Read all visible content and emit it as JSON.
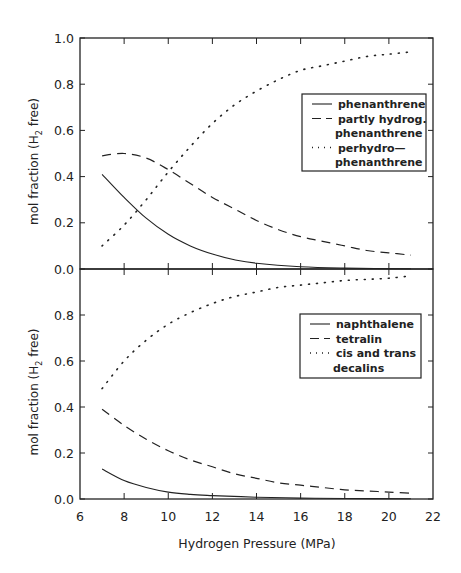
{
  "chart_data": [
    {
      "type": "line",
      "panel": "top",
      "title": "",
      "xlabel": "Hydrogen Pressure (MPa)",
      "ylabel": "mol fraction (H2 free)",
      "xlim": [
        6,
        22
      ],
      "ylim": [
        0,
        1.0
      ],
      "yticks": [
        "0.0",
        "0.2",
        "0.4",
        "0.6",
        "0.8",
        "1.0"
      ],
      "grid": false,
      "legend_position": "upper right",
      "series": [
        {
          "name": "phenanthrene",
          "style": "solid",
          "x": [
            7,
            8,
            9,
            10,
            11,
            12,
            13,
            14,
            16,
            18,
            21
          ],
          "values": [
            0.41,
            0.31,
            0.22,
            0.15,
            0.1,
            0.065,
            0.04,
            0.025,
            0.01,
            0.004,
            0.001
          ]
        },
        {
          "name": "partly hydrog. phenanthrene",
          "style": "dashed",
          "x": [
            7,
            8,
            9,
            10,
            11,
            12,
            13,
            14,
            15,
            16,
            17,
            18,
            19,
            20,
            21
          ],
          "values": [
            0.49,
            0.5,
            0.48,
            0.43,
            0.37,
            0.31,
            0.26,
            0.21,
            0.17,
            0.14,
            0.12,
            0.1,
            0.08,
            0.07,
            0.06
          ]
        },
        {
          "name": "perhydro-phenanthrene",
          "style": "dotted",
          "x": [
            7,
            8,
            9,
            10,
            11,
            12,
            13,
            14,
            15,
            16,
            17,
            18,
            19,
            20,
            21
          ],
          "values": [
            0.1,
            0.19,
            0.3,
            0.42,
            0.53,
            0.63,
            0.71,
            0.77,
            0.82,
            0.86,
            0.88,
            0.9,
            0.92,
            0.93,
            0.94
          ]
        }
      ]
    },
    {
      "type": "line",
      "panel": "bottom",
      "title": "",
      "xlabel": "Hydrogen Pressure (MPa)",
      "ylabel": "mol fraction (H2 free)",
      "xlim": [
        6,
        22
      ],
      "ylim": [
        0,
        1.0
      ],
      "xticks": [
        "6",
        "8",
        "10",
        "12",
        "14",
        "16",
        "18",
        "20",
        "22"
      ],
      "yticks": [
        "0.0",
        "0.2",
        "0.4",
        "0.6",
        "0.8"
      ],
      "grid": false,
      "legend_position": "upper right",
      "series": [
        {
          "name": "naphthalene",
          "style": "solid",
          "x": [
            7,
            8,
            9,
            10,
            11,
            12,
            14,
            16,
            18,
            21
          ],
          "values": [
            0.13,
            0.08,
            0.05,
            0.03,
            0.02,
            0.015,
            0.008,
            0.004,
            0.002,
            0.001
          ]
        },
        {
          "name": "tetralin",
          "style": "dashed",
          "x": [
            7,
            8,
            9,
            10,
            11,
            12,
            13,
            14,
            15,
            16,
            17,
            18,
            19,
            20,
            21
          ],
          "values": [
            0.39,
            0.32,
            0.26,
            0.21,
            0.17,
            0.14,
            0.11,
            0.09,
            0.07,
            0.06,
            0.05,
            0.04,
            0.035,
            0.03,
            0.025
          ]
        },
        {
          "name": "cis and trans decalins",
          "style": "dotted",
          "x": [
            7,
            8,
            9,
            10,
            11,
            12,
            13,
            14,
            15,
            16,
            17,
            18,
            19,
            20,
            21
          ],
          "values": [
            0.48,
            0.6,
            0.69,
            0.76,
            0.81,
            0.85,
            0.88,
            0.9,
            0.92,
            0.93,
            0.94,
            0.95,
            0.955,
            0.96,
            0.97
          ]
        }
      ]
    }
  ],
  "labels": {
    "xlabel": "Hydrogen Pressure (MPa)",
    "ylabel_prefix": "mol fraction (H",
    "ylabel_sub": "2",
    "ylabel_suffix": " free)",
    "top_legend": [
      {
        "lines": [
          "phenanthrene"
        ],
        "style": "solid"
      },
      {
        "lines": [
          "partly hydrog.",
          "phenanthrene"
        ],
        "style": "dashed"
      },
      {
        "lines": [
          "perhydro—",
          "phenanthrene"
        ],
        "style": "dotted"
      }
    ],
    "bottom_legend": [
      {
        "lines": [
          "naphthalene"
        ],
        "style": "solid"
      },
      {
        "lines": [
          "tetralin"
        ],
        "style": "dashed"
      },
      {
        "lines": [
          "cis and trans",
          "decalins"
        ],
        "style": "dotted"
      }
    ]
  },
  "colors": {
    "ink": "#222222",
    "background": "#ffffff"
  }
}
